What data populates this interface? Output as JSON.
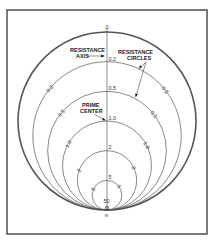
{
  "diagram": {
    "title": "Resistance circles",
    "annotations": {
      "resistance_axis": [
        "RESISTANCE",
        "AXIS"
      ],
      "resistance_circles": [
        "RESISTANCE",
        "CIRCLES"
      ],
      "prime_center": [
        "PRIME",
        "CENTER"
      ]
    },
    "axis_labels": [
      "0",
      "0.2",
      "0.5",
      "1.0",
      "2",
      "5",
      "50",
      "0",
      "∞"
    ],
    "circles": [
      {
        "r": 0,
        "label": "0",
        "side_labels": false
      },
      {
        "r": 0.2,
        "label": "0.2",
        "side_labels": true
      },
      {
        "r": 0.5,
        "label": "0.5",
        "side_labels": true
      },
      {
        "r": 1,
        "label": "1.0",
        "side_labels": true
      },
      {
        "r": 2,
        "label": "2",
        "side_labels": true
      },
      {
        "r": 5,
        "label": "5",
        "side_labels": true
      },
      {
        "r": 50,
        "label": "50",
        "side_labels": false
      }
    ],
    "bottom_labels": [
      "0",
      "∞"
    ],
    "colors": {
      "line": "#555555",
      "frame": "#222222"
    }
  }
}
